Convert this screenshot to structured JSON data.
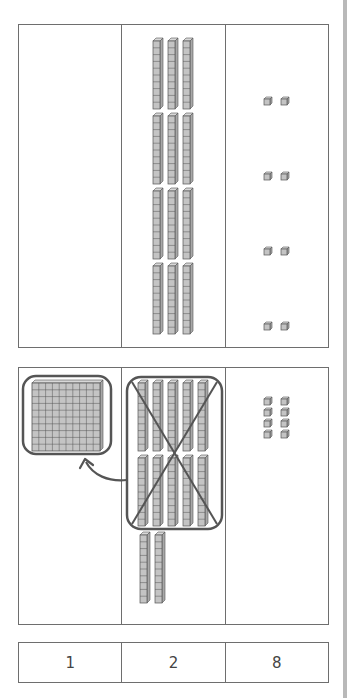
{
  "colors": {
    "border": "#6e6e6e",
    "block_fill": "#c4c4c4",
    "block_stroke": "#555555",
    "annotation": "#555555",
    "scrollbar": "#b9b9b9"
  },
  "place_value_columns": [
    "hundreds",
    "tens",
    "ones"
  ],
  "top_table": {
    "hundreds": 0,
    "tens": 12,
    "ones": 8,
    "tens_groups": 4,
    "tens_per_group": 3,
    "ones_groups": 4,
    "ones_per_group": 2
  },
  "regroup_table": {
    "hundreds": 1,
    "tens_crossed_out": 10,
    "tens_remaining": 2,
    "ones": 8,
    "annotations": [
      "circle-around-10-tens",
      "x-cross-out",
      "arrow-to-hundreds-flat",
      "circle-around-hundreds-flat"
    ]
  },
  "answer": {
    "hundreds": "1",
    "tens": "2",
    "ones": "8"
  }
}
